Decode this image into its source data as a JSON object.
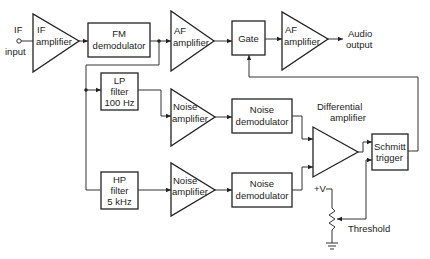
{
  "diagram": {
    "input": {
      "label_line1": "IF",
      "label_line2": "input"
    },
    "blocks": {
      "if_amplifier": {
        "line1": "IF",
        "line2": "amplifier"
      },
      "fm_demodulator": {
        "line1": "FM",
        "line2": "demodulator"
      },
      "af_amplifier_1": {
        "line1": "AF",
        "line2": "amplifier"
      },
      "gate": {
        "line1": "Gate"
      },
      "af_amplifier_2": {
        "line1": "AF",
        "line2": "amplifier"
      },
      "lp_filter": {
        "line1": "LP",
        "line2": "filter",
        "line3": "100 Hz"
      },
      "hp_filter": {
        "line1": "HP",
        "line2": "filter",
        "line3": "5 kHz"
      },
      "noise_amplifier_1": {
        "line1": "Noise",
        "line2": "amplifier"
      },
      "noise_amplifier_2": {
        "line1": "Noise",
        "line2": "amplifier"
      },
      "noise_demodulator_1": {
        "line1": "Noise",
        "line2": "demodulator"
      },
      "noise_demodulator_2": {
        "line1": "Noise",
        "line2": "demodulator"
      },
      "differential_amplifier": {
        "line1": "Differential",
        "line2": "amplifier"
      },
      "schmitt_trigger": {
        "line1": "Schmitt",
        "line2": "trigger"
      }
    },
    "output": {
      "line1": "Audio",
      "line2": "output"
    },
    "supply": {
      "label": "+V"
    },
    "threshold": {
      "label": "Threshold"
    }
  }
}
